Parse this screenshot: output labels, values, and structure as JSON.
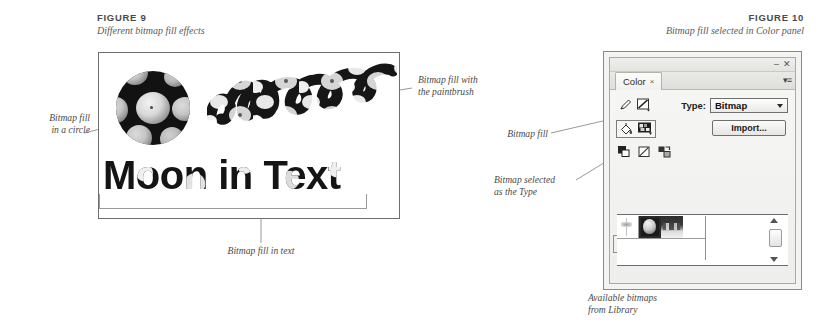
{
  "figure9": {
    "number": "FIGURE 9",
    "caption": "Different bitmap fill effects",
    "artwork": {
      "circle_alt": "bitmap-filled-circle",
      "script_alt": "moon",
      "text_sample": "Moon in Text"
    },
    "callouts": {
      "circle": {
        "line1": "Bitmap fill",
        "line2": "in a circle"
      },
      "paintbrush": {
        "line1": "Bitmap fill with",
        "line2": "the paintbrush"
      },
      "text": {
        "line1": "Bitmap fill in text"
      }
    }
  },
  "figure10": {
    "number": "FIGURE 10",
    "caption": "Bitmap fill selected in Color panel",
    "callouts": {
      "bitmap_fill": {
        "line1": "Bitmap fill"
      },
      "bitmap_type": {
        "line1": "Bitmap selected",
        "line2": "as the Type"
      },
      "available_bitmaps": {
        "line1": "Available bitmaps",
        "line2": "from Library"
      }
    },
    "panel": {
      "tab_label": "Color",
      "tab_close": "×",
      "minimize": "–",
      "close": "✕",
      "menu": "▾≡",
      "type_label": "Type:",
      "type_value": "Bitmap",
      "type_options": [
        "None",
        "Solid",
        "Linear",
        "Radial",
        "Bitmap"
      ],
      "import_label": "Import...",
      "swatches": [
        {
          "name": "swatch-blank"
        },
        {
          "name": "swatch-moon",
          "selected": true
        },
        {
          "name": "swatch-landscape"
        }
      ]
    }
  },
  "colors": {
    "ink": "#3a3a3a",
    "leader": "#8d8d8d",
    "panel_bg": "#f3f3f1",
    "panel_border": "#8a8a8a",
    "page_bg": "#ffffff"
  }
}
